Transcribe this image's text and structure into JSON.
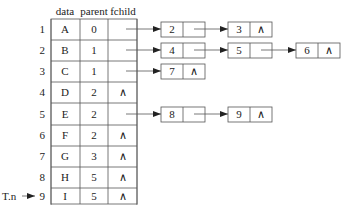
{
  "table": {
    "headers": [
      "data",
      "parent",
      "fchild"
    ],
    "rows": [
      {
        "index": "1",
        "data": "A",
        "parent": "0",
        "fchild": ""
      },
      {
        "index": "2",
        "data": "B",
        "parent": "1",
        "fchild": ""
      },
      {
        "index": "3",
        "data": "C",
        "parent": "1",
        "fchild": ""
      },
      {
        "index": "4",
        "data": "D",
        "parent": "2",
        "fchild": "∧"
      },
      {
        "index": "5",
        "data": "E",
        "parent": "2",
        "fchild": ""
      },
      {
        "index": "6",
        "data": "F",
        "parent": "2",
        "fchild": "∧"
      },
      {
        "index": "7",
        "data": "G",
        "parent": "3",
        "fchild": "∧"
      },
      {
        "index": "8",
        "data": "H",
        "parent": "5",
        "fchild": "∧"
      },
      {
        "index": "9",
        "data": "I",
        "parent": "5",
        "fchild": "∧"
      },
      {
        "index": "",
        "data": "⋮",
        "parent": "⋮",
        "fchild": "⋮"
      }
    ],
    "pointer_label": "T.n"
  },
  "child_lists": [
    {
      "row": 1,
      "nodes": [
        {
          "child": "2",
          "next": ""
        },
        {
          "child": "3",
          "next": "∧"
        }
      ]
    },
    {
      "row": 2,
      "nodes": [
        {
          "child": "4",
          "next": ""
        },
        {
          "child": "5",
          "next": ""
        },
        {
          "child": "6",
          "next": "∧"
        }
      ]
    },
    {
      "row": 3,
      "nodes": [
        {
          "child": "7",
          "next": "∧"
        }
      ]
    },
    {
      "row": 5,
      "nodes": [
        {
          "child": "8",
          "next": ""
        },
        {
          "child": "9",
          "next": "∧"
        }
      ]
    }
  ]
}
